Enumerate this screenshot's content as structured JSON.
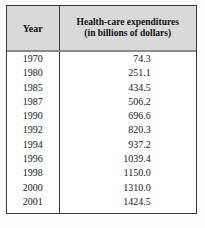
{
  "table": {
    "headers": {
      "year": "Year",
      "value_line_1": "Health-care expenditures",
      "value_line_2": "(in billions of dollars)"
    },
    "rows": [
      {
        "year": "1970",
        "value": "74.3"
      },
      {
        "year": "1980",
        "value": "251.1"
      },
      {
        "year": "1985",
        "value": "434.5"
      },
      {
        "year": "1987",
        "value": "506.2"
      },
      {
        "year": "1990",
        "value": "696.6"
      },
      {
        "year": "1992",
        "value": "820.3"
      },
      {
        "year": "1994",
        "value": "937.2"
      },
      {
        "year": "1996",
        "value": "1039.4"
      },
      {
        "year": "1998",
        "value": "1150.0"
      },
      {
        "year": "2000",
        "value": "1310.0"
      },
      {
        "year": "2001",
        "value": "1424.5"
      }
    ]
  },
  "colors": {
    "header_background": "#d9d9d9",
    "border": "#3b3b3b",
    "header_rule": "#8c8c8c",
    "text": "#1a1a1a",
    "page_background": "#fdfdfd"
  }
}
